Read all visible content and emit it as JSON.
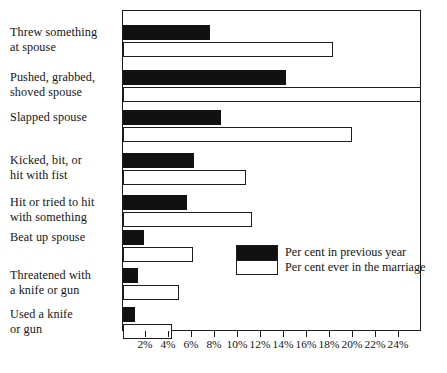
{
  "chart_data": {
    "type": "bar",
    "orientation": "horizontal",
    "title": "",
    "subtitle": "",
    "xlabel": "",
    "ylabel": "",
    "xlim": [
      0,
      26
    ],
    "grid": false,
    "legend_position": "inside-right-lower",
    "categories": [
      "Threw something at spouse",
      "Pushed, grabbed, shoved spouse",
      "Slapped spouse",
      "Kicked, bit, or hit with fist",
      "Hit or tried to hit with something",
      "Beat up spouse",
      "Threatened with a knife or gun",
      "Used a knife or gun"
    ],
    "category_lines": [
      [
        "Threw something",
        "at spouse"
      ],
      [
        "Pushed, grabbed,",
        "shoved spouse"
      ],
      [
        "Slapped spouse"
      ],
      [
        "Kicked, bit, or",
        "hit with fist"
      ],
      [
        "Hit or tried to hit",
        "with something"
      ],
      [
        "Beat up spouse"
      ],
      [
        "Threatened with",
        "a knife or gun"
      ],
      [
        "Used a knife",
        "or gun"
      ]
    ],
    "series": [
      {
        "name": "Per cent in previous year",
        "color": "#111111",
        "values": [
          7.6,
          14.2,
          8.5,
          6.2,
          5.6,
          1.8,
          1.3,
          1.0
        ]
      },
      {
        "name": "Per cent ever in the marriage",
        "color": "#ffffff",
        "values": [
          18.3,
          25.9,
          19.9,
          10.7,
          11.2,
          6.1,
          4.9,
          4.3
        ]
      }
    ],
    "xticks": [
      2,
      4,
      6,
      8,
      10,
      12,
      14,
      16,
      18,
      20,
      22,
      24
    ],
    "xticklabels": [
      "2%",
      "4%",
      "6%",
      "8%",
      "10%",
      "12%",
      "14%",
      "16%",
      "18%",
      "20%",
      "22%",
      "24%"
    ]
  },
  "legend": {
    "items": [
      {
        "label": "Per cent in previous year",
        "swatch": "dark"
      },
      {
        "label": "Per cent ever in the marriage",
        "swatch": "light"
      }
    ]
  },
  "colors": {
    "previous_year": "#111111",
    "ever_in_marriage": "#ffffff",
    "axis": "#1a1a1a",
    "text": "#141414",
    "background": "#ffffff"
  }
}
